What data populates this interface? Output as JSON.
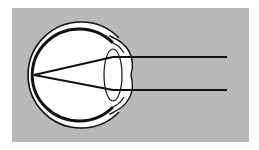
{
  "figure": {
    "title": "Eye diagram with parallel light rays converging on retina",
    "colors": {
      "background": "#ffffff",
      "panel": "#b9b9b9",
      "eye_fill": "#ffffff",
      "stroke": "#111111"
    },
    "panel": {
      "x": 12,
      "y": 8,
      "w": 237,
      "h": 134
    },
    "eye": {
      "cx": 79,
      "cy": 75,
      "outer_r": 53,
      "inner_r": 47
    },
    "rays": [
      {
        "x1": 227,
        "y1": 57,
        "x2": 112,
        "y2": 57
      },
      {
        "x1": 227,
        "y1": 90,
        "x2": 112,
        "y2": 90
      }
    ],
    "focal_point": {
      "x": 34,
      "y": 75
    }
  }
}
